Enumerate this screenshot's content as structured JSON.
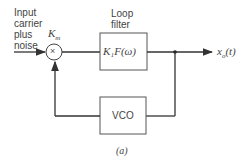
{
  "diagram": {
    "input_label": [
      "Input",
      "carrier",
      "plus",
      "noise"
    ],
    "multiplier": {
      "gain_label": "K",
      "gain_sub": "m",
      "symbol": "×"
    },
    "loop_filter": {
      "title": [
        "Loop",
        "filter"
      ],
      "content": "K₁F(ω)"
    },
    "output_label": "x",
    "output_sub": "o",
    "output_arg": "(t)",
    "vco_label": "VCO",
    "caption": "(a)"
  }
}
